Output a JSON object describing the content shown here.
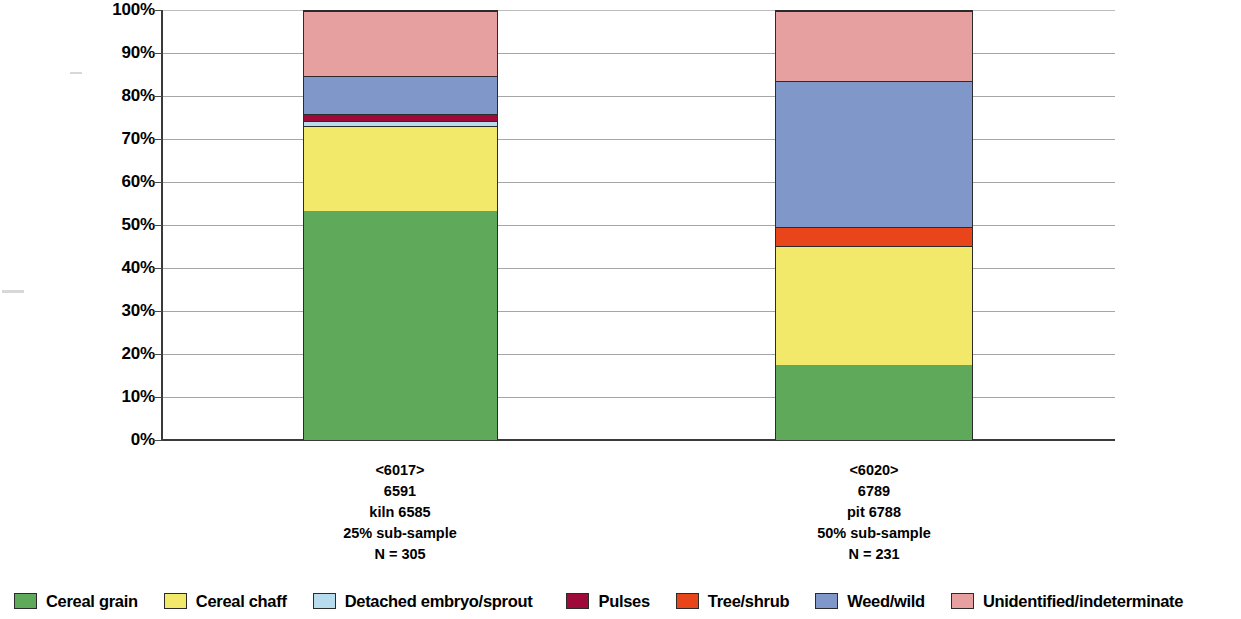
{
  "chart_data": {
    "type": "bar",
    "subtype": "stacked-percentage",
    "title": "",
    "xlabel": "",
    "ylabel": "",
    "ylim": [
      0,
      100
    ],
    "grid": true,
    "legend_position": "bottom",
    "y_tick_labels": [
      "0%",
      "10%",
      "20%",
      "30%",
      "40%",
      "50%",
      "60%",
      "70%",
      "80%",
      "90%",
      "100%"
    ],
    "y_ticks": [
      0,
      10,
      20,
      30,
      40,
      50,
      60,
      70,
      80,
      90,
      100
    ],
    "categories": [
      "<6017>",
      "<6020>"
    ],
    "category_labels": [
      [
        "<6017>",
        "6591",
        "kiln 6585",
        "25% sub-sample",
        "N = 305"
      ],
      [
        "<6020>",
        "6789",
        "pit 6788",
        "50% sub-sample",
        "N = 231"
      ]
    ],
    "series": [
      {
        "name": "Cereal grain",
        "color": "#5faa5a",
        "values": [
          53.3,
          17.5
        ]
      },
      {
        "name": "Cereal chaff",
        "color": "#f2e96b",
        "values": [
          20.0,
          27.7
        ]
      },
      {
        "name": "Detached embryo/sprout",
        "color": "#b8dced",
        "values": [
          1.0,
          0.0
        ]
      },
      {
        "name": "Pulses",
        "color": "#9e0b3a",
        "values": [
          1.8,
          0.0
        ]
      },
      {
        "name": "Tree/shrub",
        "color": "#e8451a",
        "values": [
          0.0,
          4.4
        ]
      },
      {
        "name": "Weed/wild",
        "color": "#8098c9",
        "values": [
          8.8,
          34.0
        ]
      },
      {
        "name": "Unidentified/indeterminate",
        "color": "#e6a0a0",
        "values": [
          15.1,
          16.4
        ]
      }
    ]
  },
  "legend": {
    "items": [
      {
        "label": "Cereal grain",
        "color": "#5faa5a"
      },
      {
        "label": "Cereal chaff",
        "color": "#f2e96b"
      },
      {
        "label": "Detached embryo/sprout",
        "color": "#b8dced"
      },
      {
        "label": "Pulses",
        "color": "#9e0b3a"
      },
      {
        "label": "Tree/shrub",
        "color": "#e8451a"
      },
      {
        "label": "Weed/wild",
        "color": "#8098c9"
      },
      {
        "label": "Unidentified/indeterminate",
        "color": "#e6a0a0"
      }
    ]
  }
}
